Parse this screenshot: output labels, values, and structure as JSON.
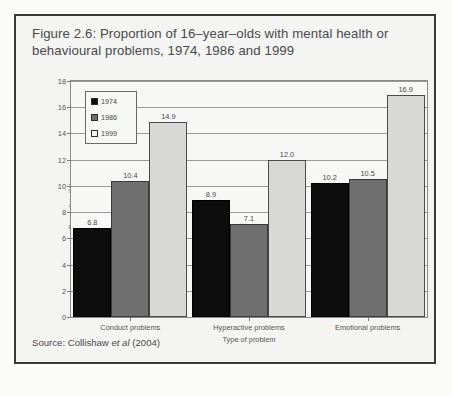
{
  "figure": {
    "title_line1": "Figure 2.6: Proportion of 16–year–olds with mental health or",
    "title_line2": "behavioural problems, 1974, 1986 and 1999",
    "source_prefix": "Source: Collishaw ",
    "source_italic": "et al",
    "source_suffix": " (2004)"
  },
  "legend": {
    "items": [
      {
        "label": "1974",
        "swatch": "black-swatch-icon",
        "color": "#0d0d0d"
      },
      {
        "label": "1986",
        "swatch": "gray-swatch-icon",
        "color": "#6f6f6f"
      },
      {
        "label": "1999",
        "swatch": "white-swatch-icon",
        "color": "#f2f2f0"
      }
    ]
  },
  "chart_data": {
    "type": "bar",
    "title": "Figure 2.6: Proportion of 16–year–olds with mental health or behavioural problems, 1974, 1986 and 1999",
    "xlabel": "Type of problem",
    "ylabel": "Proportion (%)",
    "categories": [
      "Conduct problems",
      "Hyperactive problems",
      "Emotional problems"
    ],
    "series": [
      {
        "name": "1974",
        "color": "#0d0d0d",
        "values": [
          6.8,
          8.9,
          10.2
        ]
      },
      {
        "name": "1986",
        "color": "#6f6f6f",
        "values": [
          10.4,
          7.1,
          10.5
        ]
      },
      {
        "name": "1999",
        "color": "#d8d8d6",
        "values": [
          14.9,
          12.0,
          16.9
        ]
      }
    ],
    "ylim": [
      0,
      18
    ],
    "yticks": [
      0,
      2,
      4,
      6,
      8,
      10,
      12,
      14,
      16,
      18
    ],
    "ytick_labels": [
      "0",
      "2",
      "4",
      "6",
      "8",
      "10",
      "12",
      "14",
      "16",
      "18"
    ],
    "data_labels": [
      [
        "6.8",
        "10.4",
        "14.9"
      ],
      [
        "8.9",
        "7.1",
        "12.0"
      ],
      [
        "10.2",
        "10.5",
        "16.9"
      ]
    ],
    "grid": true,
    "legend_position": "top-left",
    "bar_gap_groups": true
  }
}
